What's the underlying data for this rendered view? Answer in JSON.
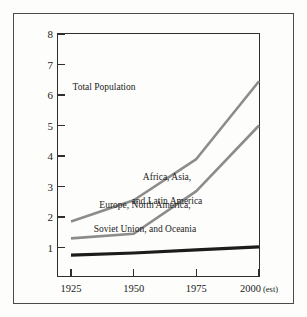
{
  "chart_data": {
    "type": "line",
    "title": "",
    "xlabel": "",
    "ylabel": "Population (in billions)",
    "categories": [
      "1925",
      "1950",
      "1975",
      "2000 (est)"
    ],
    "x_tick_labels": [
      "1925",
      "1950",
      "1975",
      "2000"
    ],
    "x_last_suffix": "(est)",
    "y_tick_labels": [
      "8",
      "7",
      "6",
      "5",
      "4",
      "3",
      "2",
      "1"
    ],
    "ylim": [
      0,
      8
    ],
    "grid": false,
    "legend_position": "inline-annotations",
    "series": [
      {
        "name": "Total Population",
        "values": [
          1.85,
          2.55,
          3.9,
          6.45
        ],
        "color": "#8c8c8c",
        "width": 2.6
      },
      {
        "name": "Africa, Asia, and Latin America",
        "values": [
          1.3,
          1.45,
          2.85,
          5.0
        ],
        "color": "#8c8c8c",
        "width": 2.6
      },
      {
        "name": "Europe, North America, Soviet Union, and Oceania",
        "values": [
          0.75,
          0.82,
          0.92,
          1.02
        ],
        "color": "#1c1c1c",
        "width": 3.2
      }
    ],
    "annotations": [
      {
        "text": "Total Population",
        "series": "Total Population"
      },
      {
        "text": "Africa, Asia,\nand Latin America",
        "series": "Africa, Asia, and Latin America"
      },
      {
        "text": "Europe, North America,\nSoviet Union, and Oceania",
        "series": "Europe, North America, Soviet Union, and Oceania"
      }
    ]
  },
  "axes": {
    "y_title": "Population (in billions)",
    "y_ticks": [
      "8",
      "7",
      "6",
      "5",
      "4",
      "3",
      "2",
      "1"
    ],
    "x_ticks": [
      "1925",
      "1950",
      "1975",
      "2000"
    ],
    "x_last_suffix": "(est)"
  },
  "annotations": {
    "total": "Total Population",
    "developing_line1": "Africa, Asia,",
    "developing_line2": "and Latin America",
    "developed_line1": "Europe, North America,",
    "developed_line2": "Soviet Union, and Oceania"
  },
  "colors": {
    "page_background": "#fdfdfb",
    "frame": "#4a4a4a",
    "axis": "#2e2e2e",
    "text": "#1c1c1c",
    "series_gray": "#8c8c8c",
    "series_black": "#1c1c1c"
  }
}
